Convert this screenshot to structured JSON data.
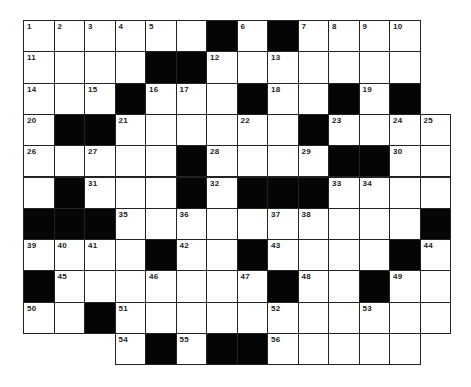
{
  "puzzle": {
    "cols": 14,
    "rows": 11,
    "cell_w": 30.5,
    "cell_h": 31.3,
    "colors": {
      "black": "#050505",
      "white": "#ffffff",
      "line": "#222222"
    },
    "legend": "grid rows: '.' = absent, '#' = black, 'o' = white",
    "grid": [
      "ooooo o#o#oooo.",
      "oooo##oooooooo.",
      "ooo#ooo#oo#o#.",
      "o##oooooo#oooo",
      "ooooo#oooo##oo",
      "o#ooo#o###oooo",
      "###oooooooooo#",
      "oooo#oo#oooo#o",
      "#ooooooo#oo#oo",
      "oo#oooooooooo o",
      "...o#o##ooooo."
    ],
    "numbers": [
      {
        "n": "1",
        "r": 0,
        "c": 0
      },
      {
        "n": "2",
        "r": 0,
        "c": 1
      },
      {
        "n": "3",
        "r": 0,
        "c": 2
      },
      {
        "n": "4",
        "r": 0,
        "c": 3
      },
      {
        "n": "5",
        "r": 0,
        "c": 4
      },
      {
        "n": "6",
        "r": 0,
        "c": 7
      },
      {
        "n": "7",
        "r": 0,
        "c": 9
      },
      {
        "n": "8",
        "r": 0,
        "c": 10
      },
      {
        "n": "9",
        "r": 0,
        "c": 11
      },
      {
        "n": "10",
        "r": 0,
        "c": 12
      },
      {
        "n": "11",
        "r": 1,
        "c": 0
      },
      {
        "n": "12",
        "r": 1,
        "c": 6
      },
      {
        "n": "13",
        "r": 1,
        "c": 8
      },
      {
        "n": "14",
        "r": 2,
        "c": 0
      },
      {
        "n": "15",
        "r": 2,
        "c": 2
      },
      {
        "n": "16",
        "r": 2,
        "c": 4
      },
      {
        "n": "17",
        "r": 2,
        "c": 5
      },
      {
        "n": "18",
        "r": 2,
        "c": 8
      },
      {
        "n": "19",
        "r": 2,
        "c": 11
      },
      {
        "n": "20",
        "r": 3,
        "c": 0
      },
      {
        "n": "21",
        "r": 3,
        "c": 3
      },
      {
        "n": "22",
        "r": 3,
        "c": 7
      },
      {
        "n": "23",
        "r": 3,
        "c": 10
      },
      {
        "n": "24",
        "r": 3,
        "c": 12
      },
      {
        "n": "25",
        "r": 3,
        "c": 13
      },
      {
        "n": "26",
        "r": 4,
        "c": 0
      },
      {
        "n": "27",
        "r": 4,
        "c": 2
      },
      {
        "n": "28",
        "r": 4,
        "c": 6
      },
      {
        "n": "29",
        "r": 4,
        "c": 9
      },
      {
        "n": "30",
        "r": 4,
        "c": 12
      },
      {
        "n": "31",
        "r": 5,
        "c": 2
      },
      {
        "n": "32",
        "r": 5,
        "c": 6
      },
      {
        "n": "33",
        "r": 5,
        "c": 10
      },
      {
        "n": "34",
        "r": 5,
        "c": 11
      },
      {
        "n": "35",
        "r": 6,
        "c": 3
      },
      {
        "n": "36",
        "r": 6,
        "c": 5
      },
      {
        "n": "37",
        "r": 6,
        "c": 8
      },
      {
        "n": "38",
        "r": 6,
        "c": 9
      },
      {
        "n": "39",
        "r": 7,
        "c": 0
      },
      {
        "n": "40",
        "r": 7,
        "c": 1
      },
      {
        "n": "41",
        "r": 7,
        "c": 2
      },
      {
        "n": "42",
        "r": 7,
        "c": 5
      },
      {
        "n": "43",
        "r": 7,
        "c": 8
      },
      {
        "n": "44",
        "r": 7,
        "c": 13
      },
      {
        "n": "45",
        "r": 8,
        "c": 1
      },
      {
        "n": "46",
        "r": 8,
        "c": 4
      },
      {
        "n": "47",
        "r": 8,
        "c": 7
      },
      {
        "n": "48",
        "r": 8,
        "c": 9
      },
      {
        "n": "49",
        "r": 8,
        "c": 12
      },
      {
        "n": "50",
        "r": 9,
        "c": 0
      },
      {
        "n": "51",
        "r": 9,
        "c": 3
      },
      {
        "n": "52",
        "r": 9,
        "c": 8
      },
      {
        "n": "53",
        "r": 9,
        "c": 11
      },
      {
        "n": "54",
        "r": 10,
        "c": 3
      },
      {
        "n": "55",
        "r": 10,
        "c": 5
      },
      {
        "n": "56",
        "r": 10,
        "c": 8
      }
    ]
  }
}
